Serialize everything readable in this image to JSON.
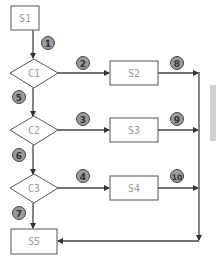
{
  "diagram": {
    "type": "flowchart",
    "colors": {
      "stroke": "#555555",
      "node_text": "#999999",
      "badge_fill": "#9a9a9a",
      "badge_stroke": "#444444",
      "side_bar": "#d0d0d0"
    },
    "nodes": [
      {
        "id": "S1",
        "shape": "rect",
        "label": "S1"
      },
      {
        "id": "C1",
        "shape": "diamond",
        "label": "C1"
      },
      {
        "id": "S2",
        "shape": "rect",
        "label": "S2"
      },
      {
        "id": "C2",
        "shape": "diamond",
        "label": "C2"
      },
      {
        "id": "S3",
        "shape": "rect",
        "label": "S3"
      },
      {
        "id": "C3",
        "shape": "diamond",
        "label": "C3"
      },
      {
        "id": "S4",
        "shape": "rect",
        "label": "S4"
      },
      {
        "id": "S5",
        "shape": "rect",
        "label": "S5"
      }
    ],
    "edges": [
      {
        "from": "S1",
        "to": "C1",
        "badge": "1"
      },
      {
        "from": "C1",
        "to": "S2",
        "badge": "2"
      },
      {
        "from": "C2",
        "to": "S3",
        "badge": "3"
      },
      {
        "from": "C3",
        "to": "S4",
        "badge": "4"
      },
      {
        "from": "C1",
        "to": "C2",
        "badge": "5"
      },
      {
        "from": "C2",
        "to": "C3",
        "badge": "6"
      },
      {
        "from": "C3",
        "to": "S5",
        "badge": "7"
      },
      {
        "from": "S2",
        "to": "S5",
        "badge": "8"
      },
      {
        "from": "S3",
        "to": "S5",
        "badge": "9"
      },
      {
        "from": "S4",
        "to": "S5",
        "badge": "10"
      }
    ]
  }
}
